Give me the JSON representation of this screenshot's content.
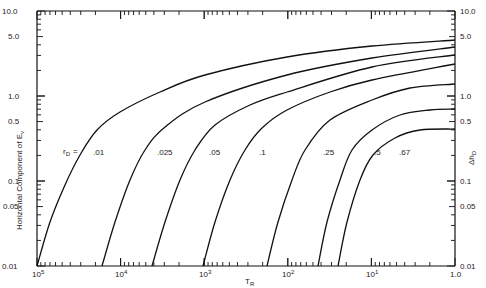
{
  "chart_data": {
    "type": "line",
    "title": "",
    "xlabel": "T_R",
    "ylabel": "Horizontal Component of E_v",
    "ylabel_right": "Δh_D",
    "x_scale": "log (decreasing left to right)",
    "y_scale": "log",
    "xlim": [
      100000,
      1
    ],
    "ylim": [
      0.01,
      10
    ],
    "x_ticks": [
      "10^5",
      "10^4",
      "10^3",
      "10^2",
      "10^1",
      "1.0"
    ],
    "y_ticks_left": [
      "0.01",
      "0.05",
      "0.1",
      "0.5",
      "1.0",
      "5.0",
      "10.0"
    ],
    "y_ticks_right": [
      "0.01",
      "0.05",
      "0.1",
      "0.5",
      "1.0",
      "5.0",
      "10.0"
    ],
    "parameter_label": "r_D =",
    "grid": false,
    "series": [
      {
        "name": ".01",
        "points": [
          [
            100000,
            0.01
          ],
          [
            70000,
            0.033
          ],
          [
            46000,
            0.1
          ],
          [
            12000,
            0.65
          ],
          [
            1000,
            1.7
          ],
          [
            100,
            2.8
          ],
          [
            10,
            3.7
          ],
          [
            1,
            4.6
          ]
        ]
      },
      {
        "name": ".025",
        "points": [
          [
            17000,
            0.01
          ],
          [
            11000,
            0.033
          ],
          [
            7000,
            0.1
          ],
          [
            1000,
            0.95
          ],
          [
            100,
            1.95
          ],
          [
            10,
            3.2
          ],
          [
            1,
            3.8
          ]
        ]
      },
      {
        "name": ".05",
        "points": [
          [
            4100,
            0.01
          ],
          [
            2800,
            0.033
          ],
          [
            1800,
            0.1
          ],
          [
            900,
            0.33
          ],
          [
            300,
            0.65
          ],
          [
            100,
            0.95
          ],
          [
            10,
            2.4
          ],
          [
            1,
            3.0
          ]
        ]
      },
      {
        "name": ".1",
        "points": [
          [
            1000,
            0.01
          ],
          [
            700,
            0.033
          ],
          [
            450,
            0.1
          ],
          [
            250,
            0.3
          ],
          [
            100,
            0.53
          ],
          [
            30,
            0.85
          ],
          [
            10,
            1.2
          ],
          [
            1,
            2.3
          ]
        ]
      },
      {
        "name": ".25",
        "points": [
          [
            170,
            0.01
          ],
          [
            125,
            0.033
          ],
          [
            85,
            0.1
          ],
          [
            35,
            0.45
          ],
          [
            10,
            0.7
          ],
          [
            3,
            0.95
          ],
          [
            1,
            1.4
          ]
        ]
      },
      {
        "name": ".5",
        "points": [
          [
            42,
            0.01
          ],
          [
            33,
            0.033
          ],
          [
            23,
            0.1
          ],
          [
            10,
            0.23
          ],
          [
            4.5,
            0.33
          ],
          [
            2,
            0.36
          ],
          [
            1,
            0.7
          ]
        ]
      },
      {
        "name": ".67",
        "points": [
          [
            24,
            0.01
          ],
          [
            19,
            0.033
          ],
          [
            13,
            0.1
          ],
          [
            9.5,
            0.19
          ],
          [
            5,
            0.3
          ],
          [
            2.5,
            0.36
          ],
          [
            1,
            0.42
          ]
        ]
      }
    ]
  },
  "labels": {
    "x_axis_title": "T",
    "x_axis_sub": "R",
    "y_axis_title": "Horizontal Component of E",
    "y_axis_sub": "v",
    "y_right_title": "Δh",
    "y_right_sub": "D",
    "param_prefix": "r",
    "param_sub": "D",
    "param_eq": "=",
    "x_ticks": [
      {
        "base": "10",
        "exp": "5"
      },
      {
        "base": "10",
        "exp": "4"
      },
      {
        "base": "10",
        "exp": "3"
      },
      {
        "base": "10",
        "exp": "2"
      },
      {
        "base": "10",
        "exp": "1"
      },
      {
        "base": "1.0",
        "exp": ""
      }
    ],
    "y_ticks": [
      "10.0",
      "5.0",
      "1.0",
      "0.5",
      "0.1",
      "0.05",
      "0.01"
    ],
    "curve_labels": [
      ".01",
      ".025",
      ".05",
      ".1",
      ".25",
      ".5",
      ".67"
    ]
  }
}
